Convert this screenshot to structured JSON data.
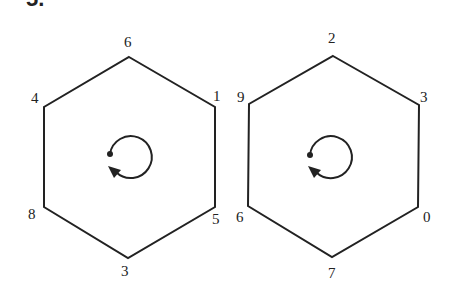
{
  "problem_number": "5.",
  "hexagons": [
    {
      "name": "left",
      "vertices": [
        {
          "position": "top",
          "label": "6"
        },
        {
          "position": "upper-right",
          "label": "1"
        },
        {
          "position": "lower-right",
          "label": "5"
        },
        {
          "position": "bottom",
          "label": "3"
        },
        {
          "position": "lower-left",
          "label": "8"
        },
        {
          "position": "upper-left",
          "label": "4"
        }
      ],
      "rotation_symbol": "counterclockwise-rotation-arrow"
    },
    {
      "name": "right",
      "vertices": [
        {
          "position": "top",
          "label": "2"
        },
        {
          "position": "upper-right",
          "label": "3"
        },
        {
          "position": "lower-right",
          "label": "0"
        },
        {
          "position": "bottom",
          "label": "7"
        },
        {
          "position": "lower-left",
          "label": "6"
        },
        {
          "position": "upper-left",
          "label": "9"
        }
      ],
      "rotation_symbol": "counterclockwise-rotation-arrow"
    }
  ],
  "colors": {
    "stroke": "#222222",
    "background": "#ffffff"
  }
}
